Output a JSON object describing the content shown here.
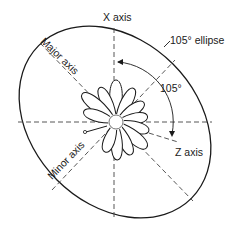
{
  "diagram": {
    "labels": {
      "x_axis": "X axis",
      "z_axis": "Z axis",
      "major_axis": "Major axis",
      "minor_axis": "Minor axis",
      "ellipse": "105° ellipse",
      "angle": "105°"
    },
    "petal_count": 12,
    "colors": {
      "stroke": "#1a1a1a",
      "background": "#ffffff"
    }
  }
}
